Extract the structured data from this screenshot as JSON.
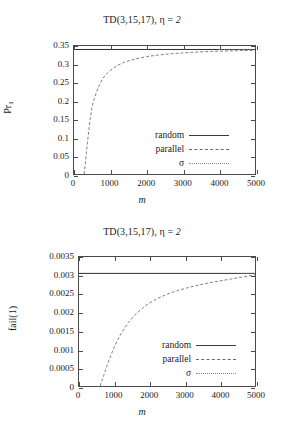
{
  "chart_data": [
    {
      "type": "line",
      "title": "TD(3,15,17), η = 2",
      "title_prefix": "TD(3,15,17), η = ",
      "title_eta_value": "2",
      "xlabel": "m",
      "ylabel": "Pr",
      "ylabel_sub": "1",
      "xlim": [
        0,
        5000
      ],
      "ylim": [
        0,
        0.35
      ],
      "grid": false,
      "legend_position": "bottom-right",
      "xticks": [
        "0",
        "1000",
        "2000",
        "3000",
        "4000",
        "5000"
      ],
      "xtick_values": [
        0,
        1000,
        2000,
        3000,
        4000,
        5000
      ],
      "yticks": [
        "0",
        "0.05",
        "0.1",
        "0.15",
        "0.2",
        "0.25",
        "0.3",
        "0.35"
      ],
      "ytick_values": [
        0,
        0.05,
        0.1,
        0.15,
        0.2,
        0.25,
        0.3,
        0.35
      ],
      "series": [
        {
          "name": "random",
          "style": "solid",
          "x": [
            0,
            5000
          ],
          "values": [
            0.3405,
            0.3405
          ]
        },
        {
          "name": "parallel",
          "style": "dashed",
          "x": [
            280,
            320,
            360,
            400,
            450,
            500,
            560,
            620,
            700,
            800,
            900,
            1000,
            1200,
            1400,
            1600,
            1800,
            2000,
            2300,
            2600,
            3000,
            3400,
            3800,
            4200,
            4600,
            5000
          ],
          "values": [
            0.0,
            0.035,
            0.075,
            0.112,
            0.152,
            0.183,
            0.206,
            0.224,
            0.243,
            0.262,
            0.274,
            0.283,
            0.297,
            0.306,
            0.312,
            0.317,
            0.321,
            0.325,
            0.328,
            0.331,
            0.3335,
            0.3352,
            0.3365,
            0.3375,
            0.3382
          ]
        },
        {
          "name": "σ",
          "style": "dotted",
          "x": [
            4000,
            4200,
            4400,
            4600,
            4800,
            5000
          ],
          "values": [
            0.3405,
            0.3404,
            0.3403,
            0.3403,
            0.3402,
            0.3402
          ]
        }
      ]
    },
    {
      "type": "line",
      "title": "TD(3,15,17), η = 2",
      "title_prefix": "TD(3,15,17), η = ",
      "title_eta_value": "2",
      "xlabel": "m",
      "ylabel": "fail(1)",
      "ylabel_sub": "",
      "xlim": [
        0,
        5000
      ],
      "ylim": [
        0,
        0.0035
      ],
      "grid": false,
      "legend_position": "bottom-right",
      "xticks": [
        "0",
        "1000",
        "2000",
        "3000",
        "4000",
        "5000"
      ],
      "xtick_values": [
        0,
        1000,
        2000,
        3000,
        4000,
        5000
      ],
      "yticks": [
        "0",
        "0.0005",
        "0.001",
        "0.0015",
        "0.002",
        "0.0025",
        "0.003",
        "0.0035"
      ],
      "ytick_values": [
        0,
        0.0005,
        0.001,
        0.0015,
        0.002,
        0.0025,
        0.003,
        0.0035
      ],
      "series": [
        {
          "name": "random",
          "style": "solid",
          "x": [
            0,
            5000
          ],
          "values": [
            0.003055,
            0.003055
          ]
        },
        {
          "name": "parallel",
          "style": "dashed",
          "x": [
            600,
            700,
            800,
            900,
            1000,
            1100,
            1200,
            1400,
            1600,
            1800,
            2000,
            2200,
            2500,
            2800,
            3100,
            3400,
            3700,
            4000,
            4300,
            4600,
            5000
          ],
          "values": [
            0.0,
            0.00028,
            0.00056,
            0.00082,
            0.00105,
            0.00125,
            0.00143,
            0.00172,
            0.00194,
            0.00211,
            0.00225,
            0.00236,
            0.00249,
            0.00259,
            0.00267,
            0.00274,
            0.0028,
            0.00285,
            0.0029,
            0.00295,
            0.003015
          ]
        },
        {
          "name": "σ",
          "style": "dotted",
          "x": [
            4600,
            4800,
            5000
          ],
          "values": [
            0.003055,
            0.003055,
            0.003055
          ]
        }
      ]
    }
  ]
}
